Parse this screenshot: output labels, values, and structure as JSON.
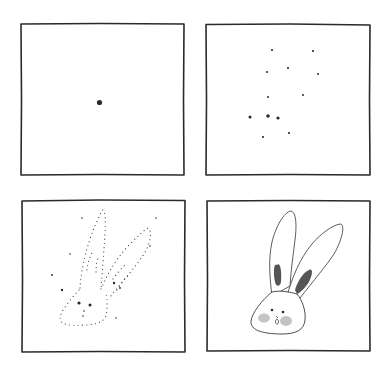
{
  "illustration": {
    "subject": "How to draw a bunny head, step by step",
    "layout": "2x2 grid of hand-drawn square panels",
    "colors": {
      "background": "#ffffff",
      "ink": "#2a2a2a",
      "ear_inner": "#555555",
      "cheek": "#b0b0b0"
    },
    "panels": [
      {
        "step": 1,
        "label": "single center dot"
      },
      {
        "step": 2,
        "label": "scattered guide dots"
      },
      {
        "step": 3,
        "label": "dotted bunny outline"
      },
      {
        "step": 4,
        "label": "finished bunny head with ears, eyes, nose and blushing cheeks"
      }
    ]
  }
}
